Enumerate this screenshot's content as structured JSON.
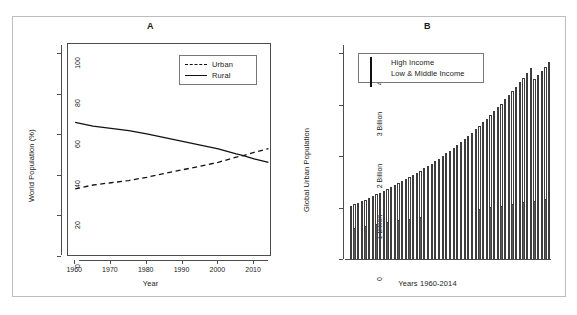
{
  "page_header": {
    "left_fragment": "",
    "right_fragment": ""
  },
  "figure": {
    "panels": [
      {
        "id": "A",
        "label": "A",
        "xlabel": "Year",
        "ylabel": "World Population (%)",
        "legend": {
          "entries": [
            {
              "label": "Urban",
              "style": "dashed"
            },
            {
              "label": "Rural",
              "style": "solid"
            }
          ]
        }
      },
      {
        "id": "B",
        "label": "B",
        "xlabel": "Years 1960-2014",
        "ylabel": "Global Urban Population",
        "legend": {
          "entries": [
            {
              "label": "High Income",
              "style": "filled"
            },
            {
              "label": "Low & Middle Income",
              "style": "empty"
            }
          ]
        }
      }
    ]
  },
  "chart_data": [
    {
      "type": "line",
      "panel": "A",
      "title": "A",
      "xlabel": "Year",
      "ylabel": "World Population (%)",
      "xlim": [
        1958,
        2015
      ],
      "ylim": [
        0,
        105
      ],
      "yticks": [
        0,
        20,
        40,
        60,
        80,
        100
      ],
      "ytick_labels": [
        "0",
        "20",
        "40",
        "60",
        "80",
        "100"
      ],
      "xticks": [
        1960,
        1970,
        1980,
        1990,
        2000,
        2010
      ],
      "xtick_labels": [
        "1960",
        "1970",
        "1980",
        "1990",
        "2000",
        "2010"
      ],
      "grid": false,
      "legend_position": "top-right",
      "annotations": [
        "Urban and Rural curves cross near 2007 at about 50%"
      ],
      "x": [
        1960,
        1965,
        1970,
        1975,
        1980,
        1985,
        1990,
        1995,
        2000,
        2005,
        2007,
        2010,
        2014
      ],
      "series": [
        {
          "name": "Urban",
          "style": "dashed",
          "color": "#111111",
          "values": [
            33.6,
            35.5,
            36.6,
            37.7,
            39.3,
            41.2,
            43.0,
            44.8,
            46.7,
            49.2,
            50.0,
            51.6,
            53.4
          ]
        },
        {
          "name": "Rural",
          "style": "solid",
          "color": "#111111",
          "values": [
            66.4,
            64.5,
            63.4,
            62.3,
            60.7,
            58.8,
            57.0,
            55.2,
            53.3,
            50.8,
            50.0,
            48.4,
            46.6
          ]
        }
      ]
    },
    {
      "type": "bar",
      "subtype": "stacked",
      "panel": "B",
      "title": "B",
      "xlabel": "Years 1960-2014",
      "ylabel": "Global Urban Population",
      "ylim": [
        0,
        4.2
      ],
      "yticks": [
        0,
        1,
        2,
        3,
        4
      ],
      "ytick_labels": [
        "0",
        "1 Billion",
        "2 Billion",
        "3 Billion",
        "4 Billion"
      ],
      "grid": false,
      "legend_position": "top-left",
      "unit": "billions of people",
      "categories": [
        "1960",
        "1961",
        "1962",
        "1963",
        "1964",
        "1965",
        "1966",
        "1967",
        "1968",
        "1969",
        "1970",
        "1971",
        "1972",
        "1973",
        "1974",
        "1975",
        "1976",
        "1977",
        "1978",
        "1979",
        "1980",
        "1981",
        "1982",
        "1983",
        "1984",
        "1985",
        "1986",
        "1987",
        "1988",
        "1989",
        "1990",
        "1991",
        "1992",
        "1993",
        "1994",
        "1995",
        "1996",
        "1997",
        "1998",
        "1999",
        "2000",
        "2001",
        "2002",
        "2003",
        "2004",
        "2005",
        "2006",
        "2007",
        "2008",
        "2009",
        "2010",
        "2011",
        "2012",
        "2013",
        "2014"
      ],
      "series": [
        {
          "name": "High Income",
          "style": "filled",
          "values": [
            0.573,
            0.586,
            0.599,
            0.613,
            0.626,
            0.639,
            0.651,
            0.663,
            0.675,
            0.687,
            0.699,
            0.711,
            0.722,
            0.733,
            0.744,
            0.754,
            0.764,
            0.774,
            0.784,
            0.794,
            0.804,
            0.813,
            0.822,
            0.831,
            0.84,
            0.85,
            0.86,
            0.87,
            0.88,
            0.89,
            0.901,
            0.912,
            0.923,
            0.933,
            0.943,
            0.953,
            0.963,
            0.974,
            0.985,
            0.996,
            1.007,
            1.018,
            1.029,
            1.04,
            1.051,
            1.062,
            1.073,
            1.084,
            1.095,
            1.105,
            1.116,
            1.128,
            1.14,
            1.152,
            1.164
          ]
        },
        {
          "name": "Low & Middle Income",
          "style": "empty",
          "values": [
            0.457,
            0.474,
            0.492,
            0.511,
            0.53,
            0.55,
            0.571,
            0.593,
            0.616,
            0.639,
            0.663,
            0.689,
            0.715,
            0.742,
            0.77,
            0.799,
            0.829,
            0.86,
            0.892,
            0.925,
            0.959,
            0.995,
            1.032,
            1.07,
            1.109,
            1.15,
            1.192,
            1.235,
            1.28,
            1.326,
            1.374,
            1.423,
            1.474,
            1.526,
            1.58,
            1.636,
            1.693,
            1.752,
            1.813,
            1.875,
            1.939,
            2.005,
            2.073,
            2.143,
            2.215,
            2.288,
            2.364,
            2.441,
            2.521,
            2.602,
            2.386,
            2.452,
            2.52,
            2.59,
            2.662
          ]
        }
      ],
      "totals": [
        1.03,
        1.06,
        1.091,
        1.124,
        1.156,
        1.189,
        1.222,
        1.256,
        1.291,
        1.326,
        1.362,
        1.4,
        1.437,
        1.475,
        1.514,
        1.553,
        1.593,
        1.634,
        1.676,
        1.719,
        1.763,
        1.808,
        1.854,
        1.901,
        1.949,
        2.0,
        2.052,
        2.105,
        2.16,
        2.216,
        2.275,
        2.335,
        2.397,
        2.459,
        2.523,
        2.589,
        2.656,
        2.726,
        2.798,
        2.871,
        2.946,
        3.023,
        3.102,
        3.183,
        3.266,
        3.35,
        3.437,
        3.525,
        3.616,
        3.707,
        3.502,
        3.58,
        3.66,
        3.742,
        3.826
      ]
    }
  ]
}
